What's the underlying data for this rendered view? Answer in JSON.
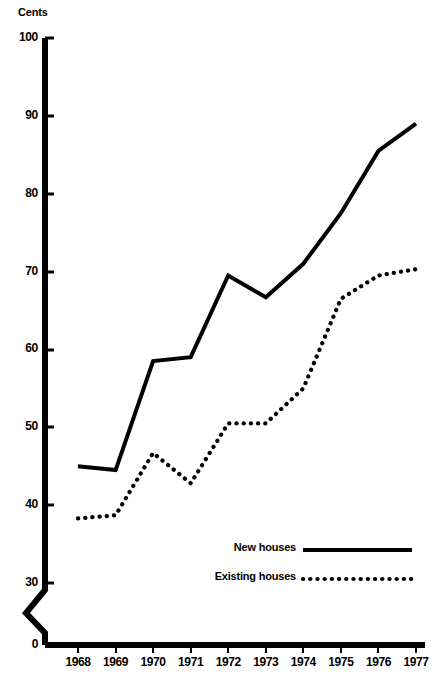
{
  "chart_data": {
    "type": "line",
    "title": "",
    "xlabel": "",
    "ylabel": "Cents",
    "categories": [
      "1968",
      "1969",
      "1970",
      "1971",
      "1972",
      "1973",
      "1974",
      "1975",
      "1976",
      "1977"
    ],
    "ylim": [
      30,
      100
    ],
    "yticks": [
      "0",
      "30",
      "40",
      "50",
      "60",
      "70",
      "80",
      "90",
      "100"
    ],
    "y_axis_break": true,
    "y_axis_break_note": "zigzag break between 0 and 30",
    "grid": false,
    "legend_position": "inside-bottom-center",
    "series": [
      {
        "name": "New houses",
        "style": "solid",
        "color": "#000000",
        "values": [
          45.0,
          44.5,
          58.5,
          59.0,
          69.5,
          66.7,
          71.0,
          77.5,
          85.5,
          89.0
        ]
      },
      {
        "name": "Existing houses",
        "style": "dotted",
        "color": "#000000",
        "values": [
          38.3,
          38.7,
          46.7,
          42.8,
          50.5,
          50.5,
          55.0,
          66.5,
          69.5,
          70.3
        ]
      }
    ]
  },
  "axis": {
    "unit_label": "Cents",
    "zero_label": "0"
  },
  "legend": {
    "items": [
      {
        "label": "New houses",
        "style": "solid"
      },
      {
        "label": "Existing houses",
        "style": "dotted"
      }
    ]
  }
}
